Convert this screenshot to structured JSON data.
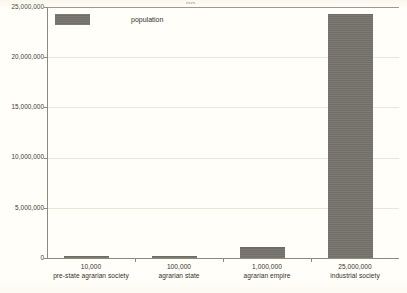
{
  "chart_data": {
    "type": "bar",
    "title": "",
    "xlabel": "",
    "ylabel": "",
    "ylim": [
      0,
      25000000
    ],
    "grid": true,
    "legend_position": "top-left",
    "categories": [
      "10,000 pre-state agrarian society",
      "100,000 agrarian state",
      "1,000,000 agrarian empire",
      "25,000,000 industrial society"
    ],
    "category_lines": [
      {
        "line1": "10,000",
        "line2": "pre-state agrarian society"
      },
      {
        "line1": "100,000",
        "line2": "agrarian state"
      },
      {
        "line1": "1,000,000",
        "line2": "agrarian empire"
      },
      {
        "line1": "25,000,000",
        "line2": "industrial society"
      }
    ],
    "series": [
      {
        "name": "population",
        "values": [
          10000,
          100000,
          1000000,
          24200000
        ]
      }
    ],
    "values": [
      10000,
      100000,
      1000000,
      24200000
    ],
    "ytick_labels": [
      "0",
      "5,000,000",
      "10,000,000",
      "15,000,000",
      "20,000,000",
      "25,000,000"
    ],
    "ytick_values": [
      0,
      5000000,
      10000000,
      15000000,
      20000000,
      25000000
    ],
    "colors": {
      "bar": "#76746d",
      "background": "#fffef8",
      "gridline": "#ece6d6",
      "axis": "#8e897e",
      "text": "#35322b"
    }
  },
  "legend": {
    "label": "population"
  },
  "title_remnant": "pp"
}
